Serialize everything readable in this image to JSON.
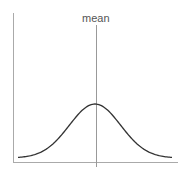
{
  "chart_data": {
    "type": "line",
    "title": "",
    "annotations": [
      "mean"
    ],
    "xlabel": "",
    "ylabel": "",
    "series": [
      {
        "name": "normal density",
        "x": [
          -3,
          -2.5,
          -2,
          -1.5,
          -1,
          -0.5,
          0,
          0.5,
          1,
          1.5,
          2,
          2.5,
          3
        ],
        "values": [
          0.011,
          0.044,
          0.135,
          0.325,
          0.607,
          0.882,
          1.0,
          0.882,
          0.607,
          0.325,
          0.135,
          0.044,
          0.011
        ]
      }
    ],
    "mean_line": {
      "x": 0,
      "label": "mean"
    },
    "grid": false,
    "legend": "none",
    "colors": {
      "curve": "#333333",
      "axes": "#999999",
      "mean_line": "#888888",
      "label": "#555555"
    }
  },
  "labels": {
    "mean": "mean"
  }
}
